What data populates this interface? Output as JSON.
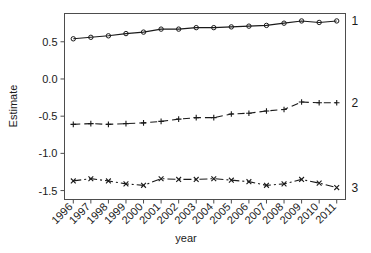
{
  "chart_data": {
    "type": "line",
    "title": "",
    "xlabel": "year",
    "ylabel": "Estimate",
    "grid": false,
    "legend_position": "right-inline",
    "x": [
      1996,
      1997,
      1998,
      1999,
      2000,
      2001,
      2002,
      2003,
      2004,
      2005,
      2006,
      2007,
      2008,
      2009,
      2010,
      2011
    ],
    "xtick_labels": [
      "1996",
      "1997",
      "1998",
      "1999",
      "2000",
      "2001",
      "2002",
      "2003",
      "2004",
      "2005",
      "2006",
      "2007",
      "2008",
      "2009",
      "2010",
      "2011"
    ],
    "ytick_labels": [
      "0.5",
      "0.0",
      "-0.5",
      "-1.0",
      "-1.5"
    ],
    "ytick_values": [
      0.5,
      0.0,
      -0.5,
      -1.0,
      -1.5
    ],
    "xlim": [
      1995.5,
      2011.5
    ],
    "ylim": [
      -1.62,
      0.88
    ],
    "series": [
      {
        "name": "1",
        "label": "1",
        "marker": "circle",
        "linestyle": "solid",
        "color": "#1a1a1a",
        "values": [
          0.54,
          0.56,
          0.58,
          0.61,
          0.63,
          0.67,
          0.67,
          0.69,
          0.69,
          0.7,
          0.71,
          0.72,
          0.75,
          0.78,
          0.76,
          0.78
        ]
      },
      {
        "name": "2",
        "label": "2",
        "marker": "plus",
        "linestyle": "dashed",
        "color": "#1a1a1a",
        "values": [
          -0.61,
          -0.6,
          -0.61,
          -0.6,
          -0.59,
          -0.57,
          -0.54,
          -0.52,
          -0.52,
          -0.47,
          -0.46,
          -0.43,
          -0.41,
          -0.31,
          -0.32,
          -0.32
        ]
      },
      {
        "name": "3",
        "label": "3",
        "marker": "cross",
        "linestyle": "dashdot",
        "color": "#1a1a1a",
        "values": [
          -1.37,
          -1.34,
          -1.37,
          -1.41,
          -1.43,
          -1.34,
          -1.35,
          -1.35,
          -1.34,
          -1.36,
          -1.38,
          -1.43,
          -1.41,
          -1.35,
          -1.4,
          -1.46
        ]
      }
    ]
  },
  "figure": {
    "background": "#ffffff",
    "axis_color": "#4d4d4d",
    "ink_color": "#1a1a1a"
  }
}
